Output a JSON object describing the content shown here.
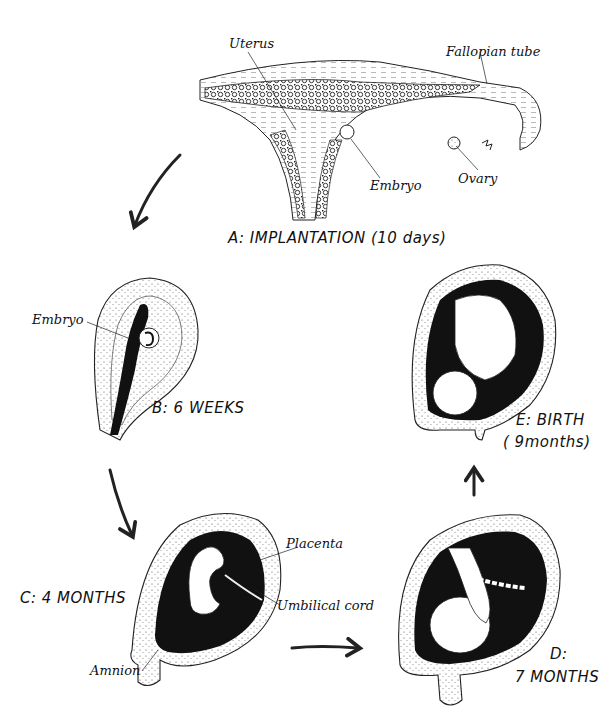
{
  "diagram": {
    "stages": [
      {
        "id": "A",
        "label": "A: IMPLANTATION (10 days)",
        "parts": [
          "Uterus",
          "Fallopian tube",
          "Embryo",
          "Ovary"
        ]
      },
      {
        "id": "B",
        "label": "B: 6 WEEKS",
        "parts": [
          "Embryo"
        ]
      },
      {
        "id": "C",
        "label": "C: 4 MONTHS",
        "parts": [
          "Placenta",
          "Umbilical cord",
          "Amnion"
        ]
      },
      {
        "id": "D",
        "label_line1": "D:",
        "label_line2": "7 MONTHS"
      },
      {
        "id": "E",
        "label_line1": "E: BIRTH",
        "label_line2": "( 9months)"
      }
    ],
    "labels": {
      "uterus": "Uterus",
      "fallopian_tube": "Fallopian tube",
      "embryo_a": "Embryo",
      "ovary": "Ovary",
      "embryo_b": "Embryo",
      "placenta": "Placenta",
      "umbilical_cord": "Umbilical cord",
      "amnion": "Amnion"
    },
    "stage_labels": {
      "a": "A: IMPLANTATION (10 days)",
      "b": "B: 6 WEEKS",
      "c": "C: 4 MONTHS",
      "d1": "D:",
      "d2": "7 MONTHS",
      "e1": "E: BIRTH",
      "e2": "( 9months)"
    },
    "flow": [
      "A",
      "B",
      "C",
      "D",
      "E"
    ]
  }
}
